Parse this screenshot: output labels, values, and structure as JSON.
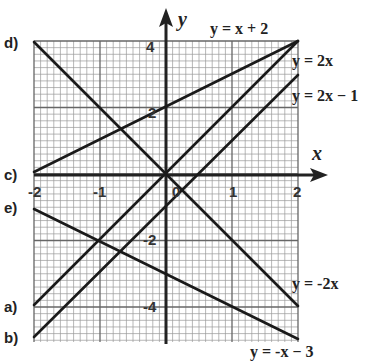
{
  "chart_data": {
    "type": "line",
    "title": "",
    "xlabel": "x",
    "ylabel": "y",
    "xlim": [
      -2,
      2
    ],
    "ylim": [
      -4.5,
      4
    ],
    "grid": true,
    "x_ticks": [
      "-2",
      "-1",
      "0",
      "1",
      "2"
    ],
    "y_ticks": [
      "4",
      "2",
      "-2",
      "-4"
    ],
    "series": [
      {
        "name": "y = 2x",
        "letter": "a)",
        "points": [
          [
            -2,
            -4
          ],
          [
            2,
            4
          ]
        ]
      },
      {
        "name": "y = 2x - 1",
        "letter": "b)",
        "points": [
          [
            -2,
            -4.5
          ],
          [
            2,
            3
          ]
        ]
      },
      {
        "name": "y = x + 2",
        "letter": "c)",
        "points": [
          [
            -2,
            0
          ],
          [
            2,
            4
          ]
        ]
      },
      {
        "name": "y = -2x",
        "letter": "d)",
        "points": [
          [
            -2,
            4
          ],
          [
            2,
            -4
          ]
        ]
      },
      {
        "name": "y = -x - 3",
        "letter": "e)",
        "points": [
          [
            -2,
            -0.5
          ],
          [
            2,
            -5
          ]
        ]
      }
    ]
  },
  "labels": {
    "x_axis": "x",
    "y_axis": "y",
    "letters": {
      "a": "a)",
      "b": "b)",
      "c": "c)",
      "d": "d)",
      "e": "e)"
    },
    "equations": {
      "x_plus_2": "y = x + 2",
      "two_x": "y = 2x",
      "two_x_minus_1": "y = 2x − 1",
      "neg_two_x": "y = -2x",
      "neg_x_minus_3": "y = -x − 3"
    },
    "ticks": {
      "xm2": "-2",
      "xm1": "-1",
      "x0": "0",
      "x1": "1",
      "x2": "2",
      "y4": "4",
      "y2": "2",
      "ym2": "-2",
      "ym4": "-4"
    }
  }
}
